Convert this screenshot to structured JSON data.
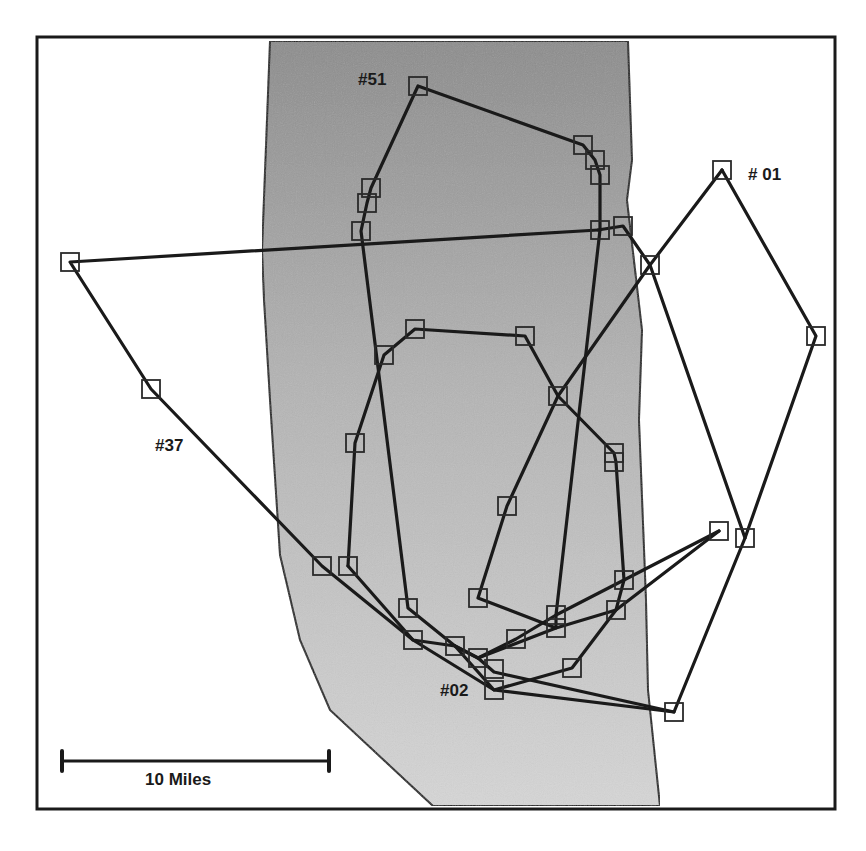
{
  "map": {
    "frame": {
      "x": 37,
      "y": 37,
      "width": 798,
      "height": 772,
      "stroke": "#1a1a1a"
    },
    "shaded_region": {
      "description": "gray stippled corridor / valley",
      "color_top": "#8c8c8c",
      "color_bottom": "#d6d6d6",
      "outline": [
        [
          272,
          41
        ],
        [
          628,
          41
        ],
        [
          632,
          160
        ],
        [
          627,
          200
        ],
        [
          642,
          330
        ],
        [
          639,
          420
        ],
        [
          646,
          600
        ],
        [
          648,
          690
        ],
        [
          660,
          806
        ],
        [
          433,
          806
        ],
        [
          330,
          710
        ],
        [
          300,
          640
        ],
        [
          280,
          555
        ],
        [
          270,
          400
        ],
        [
          264,
          300
        ],
        [
          262,
          250
        ],
        [
          270,
          41
        ]
      ]
    },
    "labels": [
      {
        "id": "51",
        "text": "#51",
        "x": 358,
        "y": 78
      },
      {
        "id": "01",
        "text": "# 01",
        "x": 748,
        "y": 173
      },
      {
        "id": "37",
        "text": "#37",
        "x": 155,
        "y": 444
      },
      {
        "id": "02",
        "text": "#02",
        "x": 440,
        "y": 689
      }
    ],
    "scale_bar": {
      "label": "10 Miles",
      "x1": 62,
      "x2": 329,
      "y": 761,
      "label_x": 145,
      "label_y": 770
    },
    "tracks": [
      {
        "id": "51",
        "points": [
          [
            600,
            175
          ],
          [
            595,
            160
          ],
          [
            583,
            145
          ],
          [
            418,
            86
          ],
          [
            371,
            188
          ],
          [
            367,
            203
          ],
          [
            361,
            231
          ],
          [
            408,
            608
          ],
          [
            455,
            646
          ],
          [
            478,
            658
          ],
          [
            556,
            628
          ],
          [
            556,
            615
          ],
          [
            600,
            230
          ],
          [
            600,
            175
          ]
        ]
      },
      {
        "id": "01",
        "points": [
          [
            722,
            170
          ],
          [
            816,
            336
          ],
          [
            745,
            538
          ],
          [
            674,
            712
          ],
          [
            494,
            690
          ],
          [
            413,
            640
          ],
          [
            348,
            566
          ]
        ]
      },
      {
        "id": "01b",
        "points": [
          [
            722,
            170
          ],
          [
            650,
            265
          ],
          [
            558,
            396
          ],
          [
            507,
            506
          ],
          [
            478,
            598
          ],
          [
            556,
            628
          ],
          [
            616,
            610
          ],
          [
            719,
            531
          ]
        ]
      },
      {
        "id": "37",
        "points": [
          [
            598,
            230
          ],
          [
            70,
            262
          ],
          [
            151,
            389
          ],
          [
            322,
            566
          ],
          [
            413,
            640
          ],
          [
            455,
            646
          ],
          [
            478,
            658
          ],
          [
            494,
            672
          ],
          [
            674,
            712
          ]
        ]
      },
      {
        "id": "37b",
        "points": [
          [
            598,
            230
          ],
          [
            623,
            226
          ],
          [
            650,
            265
          ],
          [
            745,
            538
          ]
        ]
      },
      {
        "id": "02",
        "points": [
          [
            348,
            566
          ],
          [
            355,
            443
          ],
          [
            384,
            355
          ],
          [
            415,
            329
          ],
          [
            525,
            336
          ],
          [
            558,
            396
          ],
          [
            614,
            453
          ],
          [
            616,
            462
          ],
          [
            624,
            580
          ],
          [
            616,
            610
          ],
          [
            572,
            668
          ],
          [
            494,
            690
          ],
          [
            455,
            646
          ]
        ]
      },
      {
        "id": "mid",
        "points": [
          [
            478,
            658
          ],
          [
            516,
            639
          ],
          [
            556,
            615
          ],
          [
            624,
            580
          ],
          [
            719,
            531
          ]
        ]
      }
    ],
    "fixes": [
      [
        418,
        86
      ],
      [
        583,
        145
      ],
      [
        595,
        160
      ],
      [
        600,
        175
      ],
      [
        371,
        188
      ],
      [
        367,
        203
      ],
      [
        361,
        231
      ],
      [
        600,
        230
      ],
      [
        623,
        226
      ],
      [
        650,
        265
      ],
      [
        722,
        170
      ],
      [
        816,
        336
      ],
      [
        70,
        262
      ],
      [
        151,
        389
      ],
      [
        415,
        329
      ],
      [
        384,
        355
      ],
      [
        525,
        336
      ],
      [
        558,
        396
      ],
      [
        355,
        443
      ],
      [
        614,
        453
      ],
      [
        614,
        462
      ],
      [
        507,
        506
      ],
      [
        719,
        531
      ],
      [
        745,
        538
      ],
      [
        322,
        566
      ],
      [
        348,
        566
      ],
      [
        624,
        580
      ],
      [
        478,
        598
      ],
      [
        408,
        608
      ],
      [
        556,
        615
      ],
      [
        616,
        610
      ],
      [
        556,
        628
      ],
      [
        413,
        640
      ],
      [
        516,
        639
      ],
      [
        455,
        646
      ],
      [
        478,
        658
      ],
      [
        494,
        669
      ],
      [
        572,
        668
      ],
      [
        494,
        690
      ],
      [
        674,
        712
      ]
    ]
  }
}
